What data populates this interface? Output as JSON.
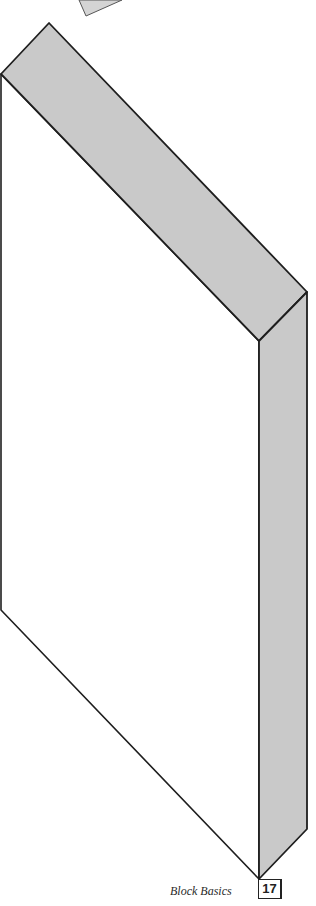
{
  "figure": {
    "colors": {
      "face_fill": "#c9c9c9",
      "front_fill": "#ffffff",
      "stroke": "#1e1e1e",
      "partial_shape_fill": "#d4d4d4"
    }
  },
  "footer": {
    "caption": "Block Basics",
    "page_number": "17"
  }
}
